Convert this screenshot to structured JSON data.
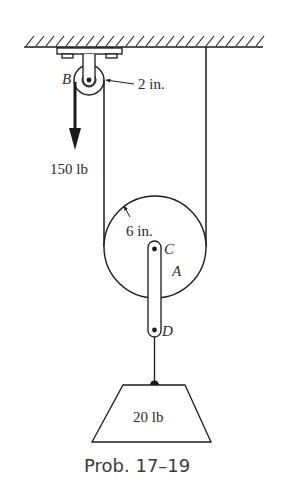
{
  "figure": {
    "caption": "Prob. 17–19",
    "labels": {
      "pulley_b": "B",
      "pulley_b_radius": "2 in.",
      "applied_force": "150 lb",
      "pulley_a_radius": "6 in.",
      "pin_c": "C",
      "pulley_a": "A",
      "pin_d": "D",
      "weight": "20 lb"
    },
    "colors": {
      "line": "#1a1a1a",
      "background": "#ffffff"
    }
  }
}
